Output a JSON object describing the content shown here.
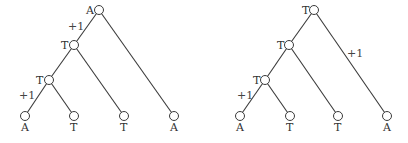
{
  "diagram": {
    "title": "",
    "trees": [
      {
        "id": "left",
        "root": {
          "label": "A"
        },
        "internal": [
          {
            "label": "T"
          },
          {
            "label": "T"
          }
        ],
        "leaves": [
          {
            "label": "A"
          },
          {
            "label": "T"
          },
          {
            "label": "T"
          },
          {
            "label": "A"
          }
        ],
        "edge_costs": [
          {
            "edge": "root-to-internal1",
            "label": "+1"
          },
          {
            "edge": "internal2-to-leaf1",
            "label": "+1"
          }
        ]
      },
      {
        "id": "right",
        "root": {
          "label": "T"
        },
        "internal": [
          {
            "label": "T"
          },
          {
            "label": "T"
          }
        ],
        "leaves": [
          {
            "label": "A"
          },
          {
            "label": "T"
          },
          {
            "label": "T"
          },
          {
            "label": "A"
          }
        ],
        "edge_costs": [
          {
            "edge": "root-to-leaf4",
            "label": "+1"
          },
          {
            "edge": "internal2-to-leaf1",
            "label": "+1"
          }
        ]
      }
    ]
  }
}
